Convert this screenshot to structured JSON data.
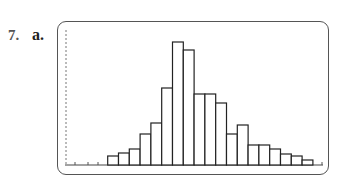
{
  "problem": {
    "number": "7.",
    "part": "a."
  },
  "chart_data": {
    "type": "bar",
    "title": "",
    "xlabel": "",
    "ylabel": "",
    "grid": false,
    "legend": "none",
    "style": "histogram (calculator screen)",
    "categories": [
      "1",
      "2",
      "3",
      "4",
      "5",
      "6",
      "7",
      "8",
      "9",
      "10",
      "11",
      "12",
      "13",
      "14",
      "15",
      "16",
      "17",
      "18",
      "19"
    ],
    "values": [
      9,
      12,
      16,
      31,
      42,
      77,
      123,
      115,
      71,
      71,
      62,
      31,
      40,
      20,
      20,
      16,
      11,
      9,
      5
    ],
    "ylim": [
      0,
      135
    ],
    "colors": {
      "bar_fill": "#ffffff",
      "bar_stroke": "#222222",
      "frame": "#555555"
    }
  }
}
